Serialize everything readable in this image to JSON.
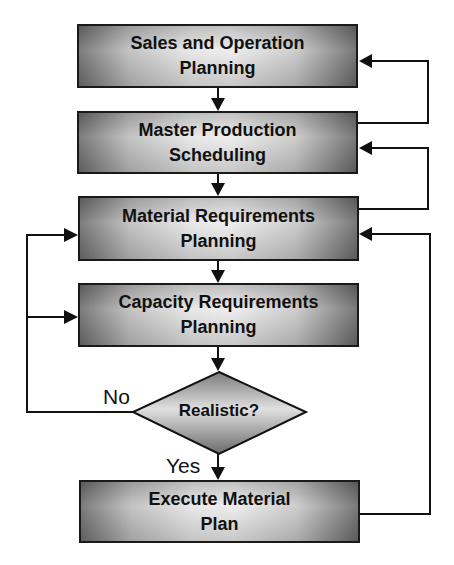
{
  "diagram": {
    "type": "flowchart",
    "nodes": [
      {
        "id": "sop",
        "label": "Sales and Operation\nPlanning",
        "shape": "rect"
      },
      {
        "id": "mps",
        "label": "Master Production\nScheduling",
        "shape": "rect"
      },
      {
        "id": "mrp",
        "label": "Material Requirements\nPlanning",
        "shape": "rect"
      },
      {
        "id": "crp",
        "label": "Capacity Requirements\nPlanning",
        "shape": "rect"
      },
      {
        "id": "decision",
        "label": "Realistic?",
        "shape": "diamond"
      },
      {
        "id": "execute",
        "label": "Execute Material\nPlan",
        "shape": "rect"
      }
    ],
    "edges": [
      {
        "from": "sop",
        "to": "mps"
      },
      {
        "from": "mps",
        "to": "mrp"
      },
      {
        "from": "mrp",
        "to": "crp"
      },
      {
        "from": "crp",
        "to": "decision"
      },
      {
        "from": "decision",
        "to": "execute",
        "label": "Yes"
      },
      {
        "from": "decision",
        "to": "mrp",
        "label": "No"
      },
      {
        "from": "decision",
        "to": "crp",
        "label": "No"
      },
      {
        "from": "mps",
        "to": "sop",
        "label": ""
      },
      {
        "from": "mrp",
        "to": "mps",
        "label": ""
      },
      {
        "from": "execute",
        "to": "mrp",
        "label": ""
      }
    ],
    "edge_labels": {
      "no": "No",
      "yes": "Yes"
    },
    "colors": {
      "line": "#111111",
      "fill_dark": "#6e6e6e",
      "fill_light": "#ececec"
    }
  }
}
